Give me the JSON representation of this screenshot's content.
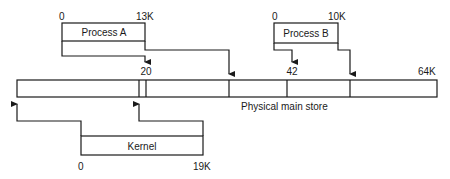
{
  "diagram": {
    "main_store": {
      "label": "Physical main store",
      "end_label": "64K"
    },
    "process_a": {
      "label": "Process A",
      "start": "0",
      "end": "13K",
      "maps_to": "20"
    },
    "process_b": {
      "label": "Process B",
      "start": "0",
      "end": "10K",
      "maps_to": "42"
    },
    "kernel": {
      "label": "Kernel",
      "start": "0",
      "end": "19K"
    }
  },
  "colors": {
    "line": "#1a1a1a",
    "background": "#ffffff"
  }
}
